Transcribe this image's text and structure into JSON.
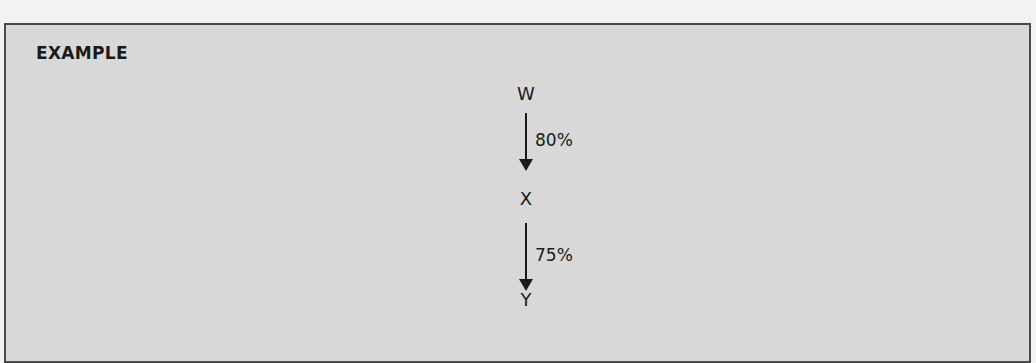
{
  "panel": {
    "title": "EXAMPLE"
  },
  "diagram": {
    "nodes": [
      {
        "id": "W",
        "label": "W"
      },
      {
        "id": "X",
        "label": "X"
      },
      {
        "id": "Y",
        "label": "Y"
      }
    ],
    "edges": [
      {
        "from": "W",
        "to": "X",
        "label": "80%"
      },
      {
        "from": "X",
        "to": "Y",
        "label": "75%"
      }
    ],
    "colors": {
      "panel_background": "#d8d8d8",
      "panel_border": "#4a4a4a",
      "text": "#1a1a1a"
    }
  }
}
